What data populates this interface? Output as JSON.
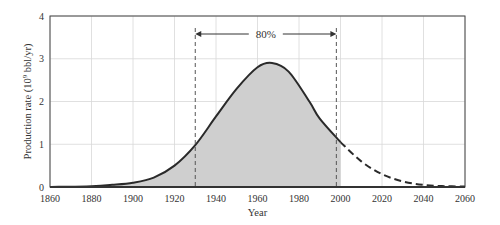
{
  "chart_data": {
    "type": "area",
    "title": "",
    "xlabel": "Year",
    "ylabel": "Production rate (10^9 bbl/yr)",
    "ylabel_parts": {
      "prefix": "Production rate (10",
      "sup": "9",
      "suffix": " bbl/yr)"
    },
    "xlim": [
      1860,
      2060
    ],
    "ylim": [
      0,
      4
    ],
    "x_ticks": [
      1860,
      1880,
      1900,
      1920,
      1940,
      1960,
      1980,
      2000,
      2020,
      2040,
      2060
    ],
    "y_ticks": [
      0,
      1,
      2,
      3,
      4
    ],
    "grid": true,
    "legend": null,
    "series": [
      {
        "name": "Historical production (solid)",
        "style": "solid",
        "x": [
          1860,
          1880,
          1890,
          1900,
          1910,
          1920,
          1930,
          1940,
          1950,
          1960,
          1967,
          1975,
          1985,
          1990,
          2000
        ],
        "values": [
          0.0,
          0.02,
          0.05,
          0.1,
          0.22,
          0.5,
          0.98,
          1.65,
          2.3,
          2.8,
          2.9,
          2.7,
          2.0,
          1.6,
          1.05
        ]
      },
      {
        "name": "Projected production (dashed)",
        "style": "dashed",
        "x": [
          2000,
          2010,
          2020,
          2030,
          2040,
          2050,
          2060
        ],
        "values": [
          1.05,
          0.6,
          0.3,
          0.13,
          0.05,
          0.02,
          0.01
        ]
      }
    ],
    "shaded_region": {
      "x_start": 1930,
      "x_end": 2000,
      "fill": "#cccccc",
      "also_shaded_before": true
    },
    "annotations": [
      {
        "text": "80%",
        "type": "double-arrow",
        "x_start": 1930,
        "x_end": 1998,
        "y": 3.8
      },
      {
        "type": "vline-dashed",
        "x": 1930
      },
      {
        "type": "vline-dashed",
        "x": 1998
      }
    ],
    "peak": {
      "year": 1967,
      "value": 2.9
    }
  },
  "labels": {
    "x_axis": "Year",
    "annotation_80": "80%"
  },
  "colors": {
    "curve": "#2a2a2a",
    "fill": "#cfcfcf",
    "grid": "#d8d8d8",
    "axis": "#444444"
  }
}
